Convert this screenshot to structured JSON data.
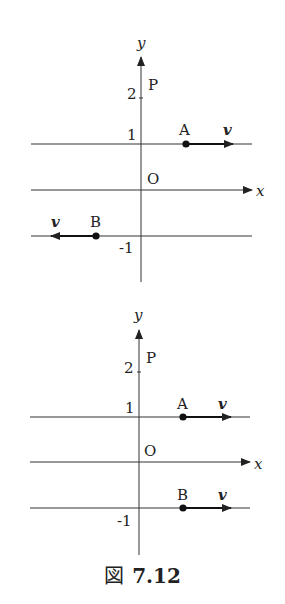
{
  "figure": {
    "caption_prefix": "図",
    "caption_number": "7.12"
  },
  "diagrams": [
    {
      "name": "top",
      "axis_labels": {
        "x": "x",
        "y": "y"
      },
      "origin_label": "O",
      "ticks": {
        "y2": "2",
        "y1": "1",
        "ym1": "-1"
      },
      "point_P": "P",
      "point_A": {
        "label": "A",
        "vector_label": "v",
        "direction": "right"
      },
      "point_B": {
        "label": "B",
        "vector_label": "v",
        "direction": "left"
      }
    },
    {
      "name": "bottom",
      "axis_labels": {
        "x": "x",
        "y": "y"
      },
      "origin_label": "O",
      "ticks": {
        "y2": "2",
        "y1": "1",
        "ym1": "-1"
      },
      "point_P": "P",
      "point_A": {
        "label": "A",
        "vector_label": "v",
        "direction": "right"
      },
      "point_B": {
        "label": "B",
        "vector_label": "v",
        "direction": "right"
      }
    }
  ],
  "colors": {
    "ink": "#222222",
    "background": "#ffffff"
  }
}
